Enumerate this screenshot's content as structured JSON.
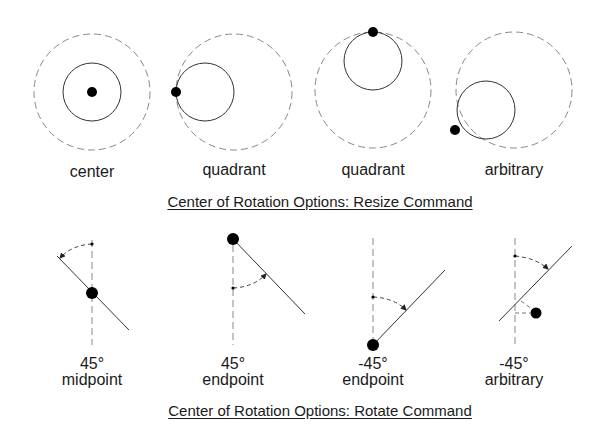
{
  "resize": {
    "title": "Center of Rotation Options: Resize Command",
    "items": [
      {
        "label": "center"
      },
      {
        "label": "quadrant"
      },
      {
        "label": "quadrant"
      },
      {
        "label": "arbitrary"
      }
    ]
  },
  "rotate": {
    "title": "Center of Rotation Options: Rotate Command",
    "items": [
      {
        "angle": "45°",
        "label": "midpoint"
      },
      {
        "angle": "45°",
        "label": "endpoint"
      },
      {
        "angle": "-45°",
        "label": "endpoint"
      },
      {
        "angle": "-45°",
        "label": "arbitrary"
      }
    ]
  },
  "colors": {
    "stroke": "#333333",
    "dashed": "#888888",
    "dot": "#000000"
  }
}
